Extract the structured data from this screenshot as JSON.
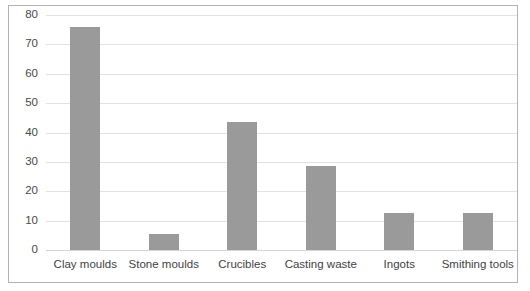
{
  "chart_data": {
    "type": "bar",
    "title": "",
    "subtitle": "",
    "xlabel": "",
    "ylabel": "",
    "categories": [
      "Clay moulds",
      "Stone moulds",
      "Crucibles",
      "Casting waste",
      "Ingots",
      "Smithing tools"
    ],
    "values": [
      76,
      5.5,
      43.5,
      28.5,
      12.5,
      12.5
    ],
    "series": [
      {
        "name": "",
        "values": [
          76,
          5.5,
          43.5,
          28.5,
          12.5,
          12.5
        ]
      }
    ],
    "ylim": [
      0,
      80
    ],
    "ytick_labels": [
      "0",
      "10",
      "20",
      "30",
      "40",
      "50",
      "60",
      "70",
      "80"
    ],
    "ytick_values": [
      0,
      10,
      20,
      30,
      40,
      50,
      60,
      70,
      80
    ],
    "grid": true,
    "grid_axis": "y",
    "legend": false,
    "legend_position": "none",
    "colors": {
      "bar": "#9a9a9a",
      "gridline": "#e2e2e2",
      "baseline": "#d5d5d5",
      "border": "#b3b3b3",
      "tick_text": "#4a4a4a",
      "category_text": "#3f3f3f",
      "background": "#ffffff"
    }
  }
}
